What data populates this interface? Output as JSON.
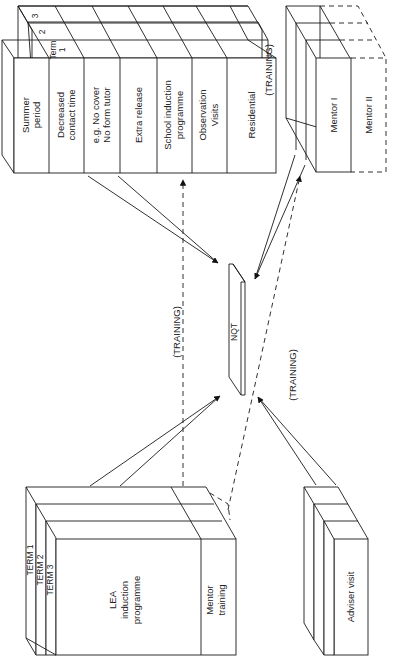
{
  "diagram": {
    "orientation": "rotated -90 degrees",
    "center": {
      "label": "NQT"
    },
    "school_block": {
      "term_labels": [
        "Term",
        "1",
        "2",
        "3"
      ],
      "rows": [
        {
          "line1": "Summer",
          "line2": "period"
        },
        {
          "line1": "Decreased",
          "line2": "contact time"
        },
        {
          "line1": "e.g. No cover",
          "line2": "No form tutor"
        },
        {
          "line1": "Extra release",
          "line2": ""
        },
        {
          "line1": "School induction",
          "line2": "programme"
        },
        {
          "line1": "Observation",
          "line2": "Visits"
        },
        {
          "line1": "Residential",
          "line2": ""
        }
      ]
    },
    "mentor_block": {
      "mentor1": "Mentor I",
      "mentor2": "Mentor II"
    },
    "lea_block": {
      "terms": [
        "TERM 1",
        "TERM 2",
        "TERM 3"
      ],
      "main_line1": "LEA",
      "main_line2": "induction",
      "main_line3": "programme",
      "mentor_line1": "Mentor",
      "mentor_line2": "training"
    },
    "adviser_block": {
      "label": "Adviser visit"
    },
    "training_labels": {
      "left": "(TRAINING)",
      "right": "(TRAINING)",
      "top_right": "(TRAINING)"
    }
  }
}
